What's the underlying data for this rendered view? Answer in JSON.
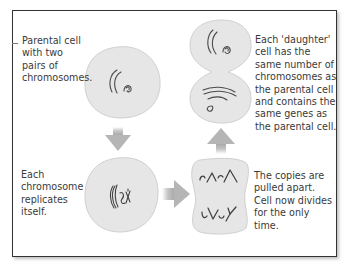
{
  "diagram": {
    "steps": [
      {
        "id": "parental",
        "label": "Parental cell\nwith two\npairs of\nchromosomes."
      },
      {
        "id": "replicate",
        "label": "Each\nchromosome\nreplicates\nitself."
      },
      {
        "id": "pulled",
        "label": "The copies are\npulled apart.\nCell now divides\nfor the only\ntime."
      },
      {
        "id": "daughter",
        "label": "Each 'daughter'\ncell has the\nsame number of\nchromosomes as\nthe parental cell\nand contains the\nsame genes as\nthe parental cell."
      }
    ],
    "flow": [
      "parental",
      "replicate",
      "pulled",
      "daughter"
    ],
    "colors": {
      "cell_fill": "#e6e6e6",
      "cell_stroke": "#cfcfcf",
      "arrow": "#b5b5b5",
      "chromosome": "#4a4a4a",
      "text": "#3a3a3a",
      "frame": "#333333"
    }
  }
}
